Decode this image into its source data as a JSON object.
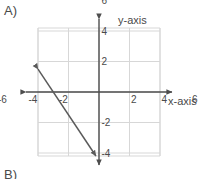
{
  "figure": {
    "part_label": "A)",
    "next_part_label": "B)",
    "x_axis_label": "x-axis",
    "y_axis_label": "y-axis",
    "colors": {
      "grid": "#d7d7d7",
      "axis": "#4d4d4d",
      "line": "#5a5a5a",
      "text": "#4a4a4a",
      "background": "#ffffff"
    }
  },
  "chart_data": {
    "type": "line",
    "title": "",
    "xlabel": "x-axis",
    "ylabel": "y-axis",
    "xlim": [
      -8,
      8
    ],
    "ylim": [
      -8,
      8
    ],
    "grid": true,
    "grid_step": 2,
    "legend": "none",
    "xticks": [
      -6,
      -4,
      -2,
      2,
      4,
      6
    ],
    "yticks": [
      -6,
      -4,
      -2,
      2,
      4,
      6
    ],
    "xtick_labels": [
      "-6",
      "-4",
      "-2",
      "2",
      "4",
      "6"
    ],
    "ytick_labels": [
      "-6",
      "-4",
      "-2",
      "2",
      "4",
      "6"
    ],
    "series": [
      {
        "name": "line",
        "equation": "y = -1.5x - 4.5",
        "slope": -1.5,
        "intercept": -4.5,
        "x_intercept": -3,
        "arrows": [
          "start",
          "end"
        ],
        "points": [
          [
            -7.5,
            6.75
          ],
          [
            3,
            -9
          ]
        ],
        "drawn_from": [
          -7.5,
          6.75
        ],
        "drawn_to": [
          3,
          -9
        ]
      }
    ]
  }
}
